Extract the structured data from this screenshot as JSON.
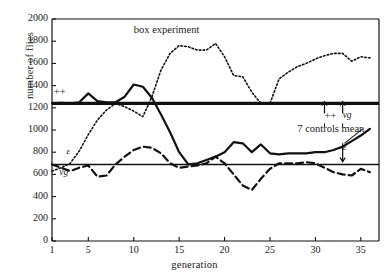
{
  "chart_data": {
    "type": "line",
    "title": "box experiment",
    "xlabel": "generation",
    "ylabel": "number of flies",
    "xlim": [
      1,
      37
    ],
    "ylim": [
      0,
      2000
    ],
    "grid": false,
    "legend": "none",
    "xticks": [
      "1",
      "5",
      "10",
      "15",
      "20",
      "25",
      "30",
      "35"
    ],
    "xtick_values": [
      1,
      5,
      10,
      15,
      20,
      25,
      30,
      35
    ],
    "yticks": [
      "0",
      "200",
      "400",
      "600",
      "800",
      "1000",
      "1200",
      "1400",
      "1600",
      "1800",
      "2000"
    ],
    "ytick_values": [
      0,
      200,
      400,
      600,
      800,
      1000,
      1200,
      1400,
      1600,
      1800,
      2000
    ],
    "reference_lines": [
      {
        "name": "++ control line",
        "y": 1240,
        "style": "solid-thick"
      },
      {
        "name": "vg / epsilon control line",
        "y": 690,
        "style": "solid-thin"
      }
    ],
    "series": [
      {
        "name": "++",
        "style": "solid",
        "x": [
          1,
          2,
          3,
          4,
          5,
          6,
          7,
          8,
          9,
          10,
          11,
          12,
          13,
          14,
          15,
          16,
          17,
          18,
          19,
          20,
          21,
          22,
          23,
          24,
          25,
          26,
          27,
          28,
          29,
          30,
          31,
          32,
          33,
          34,
          35,
          36
        ],
        "values": [
          1240,
          1245,
          1240,
          1250,
          1330,
          1260,
          1250,
          1250,
          1300,
          1410,
          1390,
          1290,
          1140,
          980,
          800,
          690,
          700,
          730,
          760,
          800,
          890,
          880,
          800,
          870,
          790,
          780,
          790,
          790,
          790,
          800,
          800,
          820,
          850,
          900,
          950,
          1010
        ]
      },
      {
        "name": "vg",
        "style": "dashed",
        "x": [
          1,
          2,
          3,
          4,
          5,
          6,
          7,
          8,
          9,
          10,
          11,
          12,
          13,
          14,
          15,
          16,
          17,
          18,
          19,
          20,
          21,
          22,
          23,
          24,
          25,
          26,
          27,
          28,
          29,
          30,
          31,
          32,
          33,
          34,
          35,
          36
        ],
        "values": [
          690,
          660,
          630,
          660,
          680,
          580,
          590,
          690,
          760,
          820,
          850,
          840,
          790,
          700,
          660,
          670,
          680,
          700,
          760,
          700,
          600,
          500,
          460,
          560,
          650,
          700,
          700,
          700,
          710,
          700,
          660,
          620,
          600,
          590,
          650,
          620
        ]
      },
      {
        "name": "epsilon",
        "style": "dotted",
        "x": [
          1,
          2,
          3,
          4,
          5,
          6,
          7,
          8,
          9,
          10,
          11,
          12,
          13,
          14,
          15,
          16,
          17,
          18,
          19,
          20,
          21,
          22,
          23,
          24,
          25,
          26,
          27,
          28,
          29,
          30,
          31,
          32,
          33,
          34,
          35,
          36
        ],
        "values": [
          630,
          660,
          700,
          810,
          960,
          1090,
          1180,
          1240,
          1210,
          1170,
          1120,
          1300,
          1540,
          1690,
          1760,
          1750,
          1720,
          1720,
          1780,
          1660,
          1490,
          1480,
          1340,
          1240,
          1240,
          1460,
          1520,
          1570,
          1600,
          1640,
          1670,
          1690,
          1690,
          1620,
          1660,
          1650
        ]
      }
    ],
    "annotations": [
      {
        "name": "title",
        "text": "box experiment",
        "x": 10,
        "y": 1890
      },
      {
        "name": "plus-plus-left",
        "text": "++",
        "x": 1.2,
        "y": 1330
      },
      {
        "name": "epsilon-left",
        "text": "ε",
        "x": 2.6,
        "y": 790
      },
      {
        "name": "vg-left",
        "text": "vg",
        "x": 1.8,
        "y": 600
      },
      {
        "name": "plus-plus-arrow",
        "text": "++",
        "x": 31,
        "y": 1120
      },
      {
        "name": "vg-arrow",
        "text": "vg",
        "x": 33,
        "y": 1120
      },
      {
        "name": "controls-mean",
        "text": "7 controls mean",
        "x": 28,
        "y": 1000
      },
      {
        "name": "epsilon-arrow",
        "text": "ε",
        "x": 33,
        "y": 830
      }
    ]
  }
}
